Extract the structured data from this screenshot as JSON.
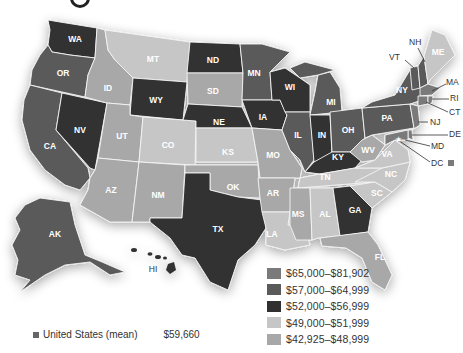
{
  "title_fragment": "g",
  "palette": {
    "tier1": "#7a7a7a",
    "tier2": "#5a5a5a",
    "tier3": "#303030",
    "tier4": "#c6c6c6",
    "tier5": "#a8a8a8"
  },
  "legend": [
    {
      "label": "$65,000–$81,902",
      "color": "#7a7a7a"
    },
    {
      "label": "$57,000–$64,999",
      "color": "#5a5a5a"
    },
    {
      "label": "$52,000–$56,999",
      "color": "#303030"
    },
    {
      "label": "$49,000–$51,999",
      "color": "#c6c6c6"
    },
    {
      "label": "$42,925–$48,999",
      "color": "#a8a8a8"
    }
  ],
  "mean": {
    "label": "United States (mean)",
    "value": "$59,660"
  },
  "states": {
    "WA": "WA",
    "OR": "OR",
    "CA": "CA",
    "NV": "NV",
    "ID": "ID",
    "MT": "MT",
    "WY": "WY",
    "UT": "UT",
    "AZ": "AZ",
    "CO": "CO",
    "NM": "NM",
    "ND": "ND",
    "SD": "SD",
    "NE": "NE",
    "KS": "KS",
    "OK": "OK",
    "TX": "TX",
    "MN": "MN",
    "IA": "IA",
    "MO": "MO",
    "AR": "AR",
    "LA": "LA",
    "WI": "WI",
    "IL": "IL",
    "MI": "MI",
    "IN": "IN",
    "OH": "OH",
    "KY": "KY",
    "TN": "TN",
    "MS": "MS",
    "AL": "AL",
    "GA": "GA",
    "FL": "FL",
    "SC": "SC",
    "NC": "NC",
    "VA": "VA",
    "WV": "WV",
    "PA": "PA",
    "NY": "NY",
    "ME": "ME",
    "AK": "AK",
    "HI": "HI"
  },
  "callouts": {
    "NH": "NH",
    "VT": "VT",
    "MA": "MA",
    "RI": "RI",
    "CT": "CT",
    "NJ": "NJ",
    "DE": "DE",
    "MD": "MD",
    "DC": "DC"
  }
}
